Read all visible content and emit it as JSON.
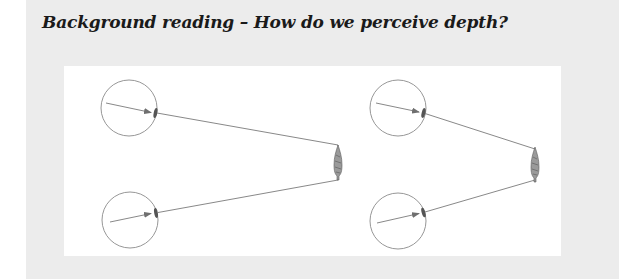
{
  "header": {
    "title": "Background reading – How do we perceive depth?"
  },
  "diagram": {
    "colors": {
      "page_background": "#ececec",
      "panel_background": "#ffffff",
      "line": "#7a7a7a",
      "lens": "#555555",
      "tree": "#6a6a6a"
    },
    "scenes": [
      {
        "name": "left-scene",
        "eyes": [
          {
            "cx": 129,
            "cy": 108,
            "r": 28,
            "lens": [
              155,
              113
            ],
            "arrow_start": [
              106,
              103
            ]
          },
          {
            "cx": 130,
            "cy": 220,
            "r": 28,
            "lens": [
              156,
              213
            ],
            "arrow_start": [
              110,
              222
            ]
          }
        ],
        "tree": {
          "x": 338,
          "top": 145,
          "bottom": 180
        }
      },
      {
        "name": "right-scene",
        "eyes": [
          {
            "cx": 398,
            "cy": 108,
            "r": 28,
            "lens": [
              423,
              113
            ],
            "arrow_start": [
              376,
              103
            ]
          },
          {
            "cx": 398,
            "cy": 221,
            "r": 28,
            "lens": [
              424,
              213
            ],
            "arrow_start": [
              377,
              223
            ]
          }
        ],
        "tree": {
          "x": 535,
          "top": 148,
          "bottom": 183
        }
      }
    ]
  }
}
